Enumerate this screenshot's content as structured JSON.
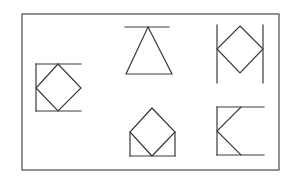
{
  "diagram": {
    "stroke_color": "#3a3a3a",
    "background": "#ffffff",
    "frame": {
      "x": 22,
      "y": 14,
      "width": 257,
      "height": 156
    },
    "figures": [
      {
        "id": "figure-1",
        "label": "diamond-in-open-bracket-left",
        "lines": [
          [
            36,
            64,
            81,
            64
          ],
          [
            36,
            64,
            36,
            111
          ],
          [
            36,
            111,
            81,
            111
          ]
        ],
        "polygon": [
          [
            58,
            64
          ],
          [
            81,
            88
          ],
          [
            58,
            111
          ],
          [
            36,
            88
          ]
        ]
      },
      {
        "id": "figure-2",
        "label": "triangle-hanging-from-bar",
        "lines": [
          [
            125,
            27,
            169,
            27
          ]
        ],
        "polygon": [
          [
            148,
            27
          ],
          [
            172,
            74
          ],
          [
            126,
            74
          ]
        ]
      },
      {
        "id": "figure-3",
        "label": "diamond-between-vertical-bars",
        "lines": [
          [
            217,
            25,
            217,
            83
          ],
          [
            263,
            25,
            263,
            83
          ]
        ],
        "polygon": [
          [
            240,
            26
          ],
          [
            263,
            49
          ],
          [
            240,
            73
          ],
          [
            217,
            49
          ]
        ]
      },
      {
        "id": "figure-4",
        "label": "diamond-on-open-box",
        "lines": [
          [
            130,
            132,
            130,
            156
          ],
          [
            130,
            156,
            175,
            156
          ],
          [
            175,
            156,
            175,
            132
          ]
        ],
        "polygon": [
          [
            152,
            108
          ],
          [
            175,
            132
          ],
          [
            152,
            156
          ],
          [
            130,
            132
          ]
        ]
      },
      {
        "id": "figure-5",
        "label": "chevron-in-open-bracket",
        "lines": [
          [
            217,
            107,
            264,
            107
          ],
          [
            217,
            107,
            217,
            155
          ],
          [
            217,
            155,
            264,
            155
          ]
        ],
        "polyline": [
          [
            241,
            107
          ],
          [
            217,
            131
          ],
          [
            241,
            155
          ]
        ]
      }
    ]
  }
}
